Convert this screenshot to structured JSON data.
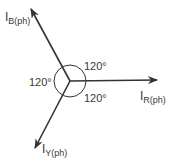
{
  "diagram": {
    "stroke_color": "#333333",
    "center": {
      "x": 70,
      "y": 81
    },
    "circle_radius": 16,
    "phasors": [
      {
        "id": "R",
        "label_main": "I",
        "label_sub": "R(ph)",
        "tip": {
          "x": 157,
          "y": 80
        }
      },
      {
        "id": "B",
        "label_main": "I",
        "label_sub": "B(ph)",
        "tip": {
          "x": 31,
          "y": 9
        }
      },
      {
        "id": "Y",
        "label_main": "I",
        "label_sub": "Y(ph)",
        "tip": {
          "x": 35,
          "y": 148
        }
      }
    ],
    "angles": [
      {
        "position": "upper-right",
        "text": "120°"
      },
      {
        "position": "left",
        "text": "120°"
      },
      {
        "position": "lower-right",
        "text": "120°"
      }
    ]
  }
}
